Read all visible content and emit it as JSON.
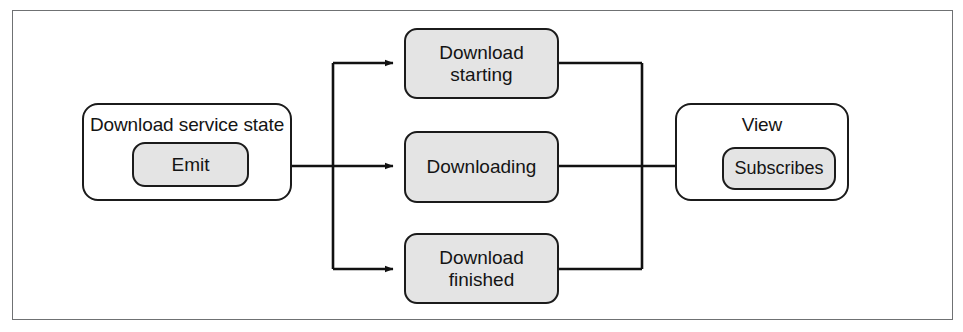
{
  "figure": {
    "kind": "block-diagram",
    "background_color": "#ffffff",
    "frame_color": "#6f7173",
    "node_stroke_color": "#1b1b1b",
    "node_fill_color": "#e4e4e4",
    "connector_color": "#111111"
  },
  "nodes": {
    "service_state": {
      "title": "Download service state",
      "inner": {
        "label": "Emit"
      }
    },
    "states": [
      {
        "id": "download-starting",
        "label": "Download\nstarting",
        "line1": "Download",
        "line2": "starting"
      },
      {
        "id": "downloading",
        "label": "Downloading",
        "line1": "Downloading",
        "line2": ""
      },
      {
        "id": "download-finished",
        "label": "Download\nfinished",
        "line1": "Download",
        "line2": "finished"
      }
    ],
    "view": {
      "title": "View",
      "inner": {
        "label": "Subscribes"
      }
    }
  },
  "connectors": [
    {
      "from": "Emit",
      "to": "Download starting",
      "arrow": true
    },
    {
      "from": "Emit",
      "to": "Downloading",
      "arrow": true
    },
    {
      "from": "Emit",
      "to": "Download finished",
      "arrow": true
    },
    {
      "from": "Download starting",
      "to": "Subscribes",
      "arrow": true
    },
    {
      "from": "Downloading",
      "to": "Subscribes",
      "arrow": true
    },
    {
      "from": "Download finished",
      "to": "Subscribes",
      "arrow": true
    }
  ]
}
